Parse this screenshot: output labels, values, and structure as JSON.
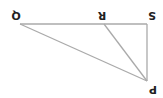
{
  "diagram": {
    "type": "geometry-triangle",
    "orientation": "rotated-180",
    "points": {
      "Q": {
        "label": "Q",
        "x": 20,
        "y": 24,
        "lx": 16,
        "ly": 15
      },
      "R": {
        "label": "R",
        "x": 104,
        "y": 24,
        "lx": 102,
        "ly": 15
      },
      "S": {
        "label": "S",
        "x": 147,
        "y": 24,
        "lx": 152,
        "ly": 15
      },
      "P": {
        "label": "P",
        "x": 147,
        "y": 81,
        "lx": 153,
        "ly": 89
      }
    },
    "segments": [
      [
        "Q",
        "S"
      ],
      [
        "S",
        "P"
      ],
      [
        "P",
        "Q"
      ],
      [
        "R",
        "P"
      ]
    ],
    "line_color": "#aaaaaa",
    "label_color": "#222222"
  }
}
